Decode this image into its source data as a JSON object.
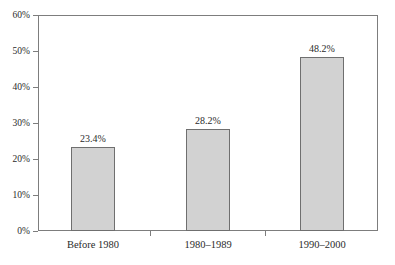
{
  "chart_data": {
    "type": "bar",
    "title": "",
    "subtitle": "",
    "xlabel": "",
    "ylabel": "",
    "categories": [
      "Before 1980",
      "1980–1989",
      "1990–2000"
    ],
    "values": [
      23.4,
      28.2,
      48.2
    ],
    "value_labels": [
      "23.4%",
      "28.2%",
      "48.2%"
    ],
    "ylim": [
      0,
      60
    ],
    "ytick_values": [
      0,
      10,
      20,
      30,
      40,
      50,
      60
    ],
    "ytick_labels": [
      "0%",
      "10%",
      "20%",
      "30%",
      "40%",
      "50%",
      "60%"
    ],
    "grid": false,
    "legend": null,
    "series": [
      {
        "name": "",
        "values": [
          23.4,
          28.2,
          48.2
        ]
      }
    ],
    "colors": {
      "bar_fill": "#d2d2d2",
      "bar_stroke": "#6f6f6f",
      "axis": "#7d7d7d",
      "text": "#2b2b2b",
      "background": "#ffffff"
    }
  }
}
